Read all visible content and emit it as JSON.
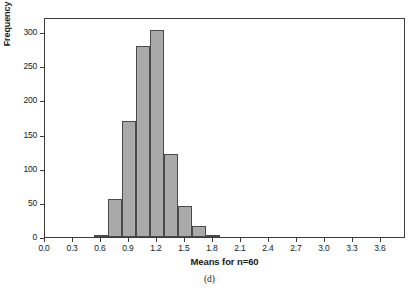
{
  "figure": {
    "caption": "(d)",
    "background_color": "#ffffff"
  },
  "chart_data": {
    "type": "bar",
    "title": "",
    "subtitle": "",
    "xlabel": "Means for n=60",
    "ylabel": "Frequency",
    "xlim": [
      0.0,
      3.87
    ],
    "ylim": [
      0,
      322
    ],
    "grid": false,
    "legend": null,
    "bar_fill_color": "#a9a9a9",
    "bar_edge_color": "#4a4a4a",
    "axis_color": "#3c3c3c",
    "bin_width": 0.15,
    "xticks": [
      "0.0",
      "0.3",
      "0.6",
      "0.9",
      "1.2",
      "1.5",
      "1.8",
      "2.1",
      "2.4",
      "2.7",
      "3.0",
      "3.3",
      "3.6"
    ],
    "xtick_values": [
      0.0,
      0.3,
      0.6,
      0.9,
      1.2,
      1.5,
      1.8,
      2.1,
      2.4,
      2.7,
      3.0,
      3.3,
      3.6
    ],
    "yticks": [
      "0",
      "50",
      "100",
      "150",
      "200",
      "250",
      "300"
    ],
    "ytick_values": [
      0,
      50,
      100,
      150,
      200,
      250,
      300
    ],
    "bins": [
      {
        "left": 0.525,
        "right": 0.675,
        "value": 2
      },
      {
        "left": 0.675,
        "right": 0.825,
        "value": 55
      },
      {
        "left": 0.825,
        "right": 0.975,
        "value": 170
      },
      {
        "left": 0.975,
        "right": 1.125,
        "value": 280
      },
      {
        "left": 1.125,
        "right": 1.275,
        "value": 303
      },
      {
        "left": 1.275,
        "right": 1.425,
        "value": 121
      },
      {
        "left": 1.425,
        "right": 1.575,
        "value": 46
      },
      {
        "left": 1.575,
        "right": 1.725,
        "value": 16
      },
      {
        "left": 1.725,
        "right": 1.875,
        "value": 1
      }
    ],
    "categories": [
      "0.60",
      "0.75",
      "0.90",
      "1.05",
      "1.20",
      "1.35",
      "1.50",
      "1.65",
      "1.80"
    ],
    "values": [
      2,
      55,
      170,
      280,
      303,
      121,
      46,
      16,
      1
    ]
  }
}
